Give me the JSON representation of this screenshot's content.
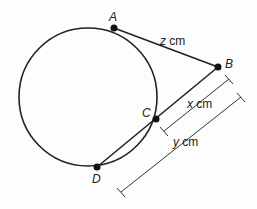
{
  "diagram": {
    "points": {
      "A": {
        "label": "A",
        "x": 114,
        "y": 28
      },
      "B": {
        "label": "B",
        "x": 218,
        "y": 67
      },
      "C": {
        "label": "C",
        "x": 156,
        "y": 119
      },
      "D": {
        "label": "D",
        "x": 97,
        "y": 167
      }
    },
    "circle": {
      "cx": 88,
      "cy": 97,
      "r": 69
    },
    "measures": {
      "z": {
        "var": "z",
        "unit": " cm"
      },
      "x": {
        "var": "x",
        "unit": " cm"
      },
      "y": {
        "var": "y",
        "unit": " cm"
      }
    },
    "colors": {
      "stroke": "#222222",
      "background": "#fdfdfd"
    }
  }
}
